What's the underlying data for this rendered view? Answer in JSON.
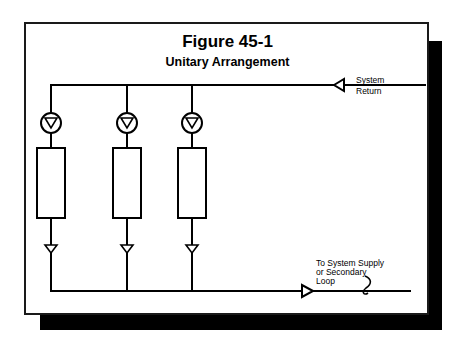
{
  "figure": {
    "title": "Figure 45-1",
    "subtitle": "Unitary Arrangement"
  },
  "labels": {
    "system_return_line1": "System",
    "system_return_line2": "Return",
    "supply_line1": "To System Supply",
    "supply_line2": "or Secondary",
    "supply_line3": "Loop"
  },
  "diagram": {
    "branches": [
      {
        "id": 1,
        "pump": "pump-1",
        "coil": "coil-1",
        "x": 51
      },
      {
        "id": 2,
        "pump": "pump-2",
        "coil": "coil-2",
        "x": 127
      },
      {
        "id": 3,
        "pump": "pump-3",
        "coil": "coil-3",
        "x": 192
      }
    ],
    "return_header": {
      "direction": "right-to-left"
    },
    "supply_header": {
      "direction": "left-to-right"
    },
    "colors": {
      "line": "#000000",
      "background": "#ffffff",
      "shadow": "#000000"
    }
  }
}
